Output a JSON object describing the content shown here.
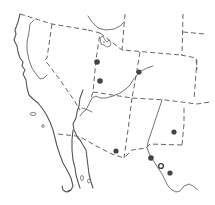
{
  "map": {
    "title": "",
    "region": "Southwestern United States and northwestern Mexico",
    "style": "outline map with dashed state boundaries",
    "colors": {
      "line": "#666666",
      "coast": "#555555",
      "dot": "#444444",
      "background": "#ffffff"
    },
    "occurrence_points": [
      {
        "x": 97,
        "y": 62
      },
      {
        "x": 100,
        "y": 81
      },
      {
        "x": 139,
        "y": 72
      },
      {
        "x": 174,
        "y": 132
      },
      {
        "x": 116,
        "y": 151
      },
      {
        "x": 151,
        "y": 158
      },
      {
        "x": 161,
        "y": 166
      },
      {
        "x": 170,
        "y": 173
      }
    ]
  }
}
